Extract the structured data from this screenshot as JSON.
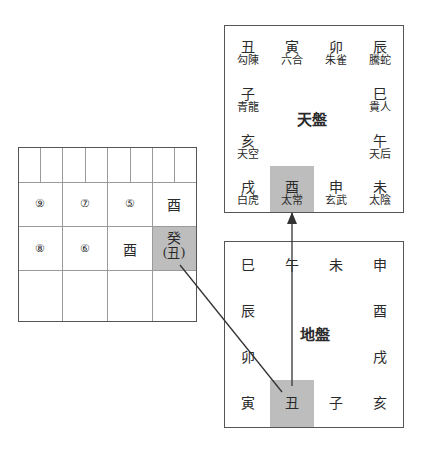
{
  "heaven_plate": {
    "title": "天盤",
    "top_row": [
      {
        "branch": "丑",
        "god": "勾陳"
      },
      {
        "branch": "寅",
        "god": "六合"
      },
      {
        "branch": "卯",
        "god": "朱雀"
      },
      {
        "branch": "辰",
        "god": "騰蛇"
      }
    ],
    "left_col": [
      {
        "branch": "子",
        "god": "青龍"
      },
      {
        "branch": "亥",
        "god": "天空"
      }
    ],
    "right_col": [
      {
        "branch": "巳",
        "god": "貴人"
      },
      {
        "branch": "午",
        "god": "天后"
      }
    ],
    "bottom_row": [
      {
        "branch": "戌",
        "god": "白虎"
      },
      {
        "branch": "酉",
        "god": "太常",
        "highlighted": true
      },
      {
        "branch": "申",
        "god": "玄武"
      },
      {
        "branch": "未",
        "god": "太陰"
      }
    ]
  },
  "earth_plate": {
    "title": "地盤",
    "top_row": [
      "巳",
      "午",
      "未",
      "申"
    ],
    "left_col": [
      "辰",
      "卯"
    ],
    "right_col": [
      "酉",
      "戌"
    ],
    "bottom_row": [
      "寅",
      "丑",
      "子",
      "亥"
    ],
    "highlighted": "丑"
  },
  "lesson_grid": {
    "row2": [
      "⑨",
      "⑦",
      "⑤",
      "酉"
    ],
    "row3": [
      "⑧",
      "⑥",
      "酉",
      "癸"
    ],
    "row3_sub": "(丑)",
    "highlight_color": "#bdbdbd"
  }
}
